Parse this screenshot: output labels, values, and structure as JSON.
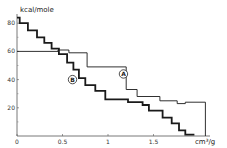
{
  "chart_data": {
    "type": "line",
    "subtype": "step",
    "title": "",
    "xlabel": "cm³/g",
    "ylabel": "kcal/mole",
    "xlim": [
      0,
      2.0
    ],
    "ylim": [
      0,
      88
    ],
    "grid": false,
    "legend": "inline circled labels",
    "x_ticks": [
      {
        "value": 0,
        "label": "0"
      },
      {
        "value": 0.5,
        "label": "0.5"
      },
      {
        "value": 1,
        "label": "1"
      },
      {
        "value": 1.5,
        "label": "1.5"
      }
    ],
    "y_ticks": [
      {
        "value": 20,
        "label": "20"
      },
      {
        "value": 40,
        "label": "40"
      },
      {
        "value": 60,
        "label": "60"
      },
      {
        "value": 80,
        "label": "80"
      }
    ],
    "series": [
      {
        "name": "A",
        "style": "thin",
        "label_pos": [
          1.17,
          44
        ],
        "steps": [
          [
            0.0,
            60
          ],
          [
            0.45,
            60
          ],
          [
            0.45,
            61
          ],
          [
            0.57,
            61
          ],
          [
            0.57,
            59
          ],
          [
            0.77,
            59
          ],
          [
            0.77,
            49
          ],
          [
            1.2,
            49
          ],
          [
            1.2,
            33
          ],
          [
            1.32,
            33
          ],
          [
            1.32,
            28
          ],
          [
            1.57,
            28
          ],
          [
            1.57,
            25
          ],
          [
            1.76,
            25
          ],
          [
            1.76,
            23
          ],
          [
            1.85,
            23
          ],
          [
            1.85,
            24
          ],
          [
            2.07,
            24
          ],
          [
            2.07,
            0
          ]
        ]
      },
      {
        "name": "B",
        "style": "thick",
        "label_pos": [
          0.61,
          40
        ],
        "steps": [
          [
            0.0,
            84
          ],
          [
            0.03,
            84
          ],
          [
            0.03,
            80
          ],
          [
            0.12,
            80
          ],
          [
            0.12,
            75
          ],
          [
            0.22,
            75
          ],
          [
            0.22,
            70
          ],
          [
            0.3,
            70
          ],
          [
            0.3,
            66
          ],
          [
            0.38,
            66
          ],
          [
            0.38,
            62
          ],
          [
            0.46,
            62
          ],
          [
            0.46,
            58
          ],
          [
            0.55,
            58
          ],
          [
            0.55,
            52
          ],
          [
            0.62,
            52
          ],
          [
            0.62,
            47
          ],
          [
            0.68,
            47
          ],
          [
            0.68,
            41
          ],
          [
            0.75,
            41
          ],
          [
            0.75,
            36
          ],
          [
            0.86,
            36
          ],
          [
            0.86,
            32
          ],
          [
            0.97,
            32
          ],
          [
            0.97,
            26
          ],
          [
            1.22,
            26
          ],
          [
            1.22,
            24
          ],
          [
            1.38,
            24
          ],
          [
            1.38,
            22
          ],
          [
            1.45,
            22
          ],
          [
            1.45,
            18
          ],
          [
            1.6,
            18
          ],
          [
            1.6,
            13
          ],
          [
            1.7,
            13
          ],
          [
            1.7,
            9
          ],
          [
            1.78,
            9
          ],
          [
            1.78,
            4
          ],
          [
            1.85,
            4
          ],
          [
            1.85,
            1
          ],
          [
            1.95,
            1
          ]
        ]
      }
    ]
  },
  "layout": {
    "origin_px": [
      17,
      136
    ],
    "px_per_x": 91,
    "px_per_y": 1.41,
    "x_axis_end_px": 210,
    "y_axis_top_px": 14,
    "line_color": "#1a1a1a",
    "thin_width": 0.9,
    "thick_width": 1.8
  }
}
